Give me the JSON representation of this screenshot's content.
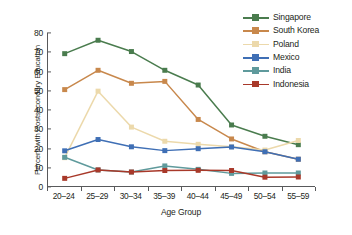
{
  "chart_data": {
    "type": "line",
    "title": "",
    "xlabel": "Age Group",
    "ylabel": "Percent with Postsecondary Education",
    "categories": [
      "20–24",
      "25–29",
      "30–34",
      "35–39",
      "40–44",
      "45–49",
      "50–54",
      "55–59"
    ],
    "ylim": [
      0,
      80
    ],
    "yticks": [
      0,
      10,
      20,
      30,
      40,
      50,
      60,
      70,
      80
    ],
    "grid": false,
    "legend_position": "top-right",
    "series": [
      {
        "name": "Singapore",
        "color": "#4a7c4e",
        "values": [
          69.2,
          76.2,
          70.3,
          60.5,
          52.8,
          31.9,
          26.0,
          21.6
        ]
      },
      {
        "name": "South Korea",
        "color": "#c8884c",
        "values": [
          50.4,
          60.5,
          53.7,
          54.7,
          34.8,
          24.6,
          17.9,
          14.0
        ]
      },
      {
        "name": "Poland",
        "color": "#ecd9ab",
        "values": [
          14.8,
          49.6,
          30.8,
          23.4,
          21.8,
          20.5,
          18.8,
          23.8
        ]
      },
      {
        "name": "Mexico",
        "color": "#3f6fb5",
        "values": [
          18.4,
          24.3,
          20.5,
          18.5,
          19.5,
          20.4,
          17.9,
          14.0
        ]
      },
      {
        "name": "India",
        "color": "#5f9a9c",
        "values": [
          15.0,
          8.4,
          7.3,
          10.5,
          8.7,
          6.6,
          6.8,
          6.8
        ]
      },
      {
        "name": "Indonesia",
        "color": "#a8392a",
        "values": [
          4.0,
          8.4,
          7.3,
          8.1,
          8.2,
          8.1,
          4.6,
          4.7
        ]
      }
    ]
  },
  "legend": {
    "items": [
      {
        "label": "Singapore"
      },
      {
        "label": "South Korea"
      },
      {
        "label": "Poland"
      },
      {
        "label": "Mexico"
      },
      {
        "label": "India"
      },
      {
        "label": "Indonesia"
      }
    ]
  }
}
